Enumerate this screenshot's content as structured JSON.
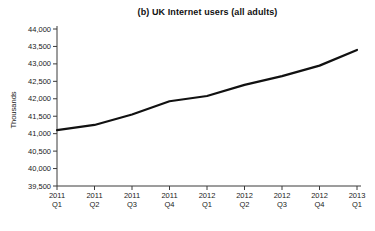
{
  "chart_data": {
    "type": "line",
    "title": "(b) UK Internet users (all adults)",
    "ylabel": "Thousands",
    "xlabel": "",
    "categories": [
      "2011 Q1",
      "2011 Q2",
      "2011 Q3",
      "2011 Q4",
      "2012 Q1",
      "2012 Q2",
      "2012 Q3",
      "2012 Q4",
      "2013 Q1"
    ],
    "series": [
      {
        "name": "UK Internet users (all adults)",
        "values": [
          41100,
          41250,
          41550,
          41930,
          42080,
          42400,
          42650,
          42950,
          43400
        ]
      }
    ],
    "ylim": [
      39500,
      44000
    ],
    "ytick_step": 500,
    "ytick_labels": [
      "39,500",
      "40,000",
      "40,500",
      "41,000",
      "41,500",
      "42,000",
      "42,500",
      "43,000",
      "43,500",
      "44,000"
    ],
    "grid": false,
    "legend": "none",
    "line_color": "#111111",
    "axis_color": "#3a3a3a",
    "tick_label_color": "#1a1a1a"
  }
}
